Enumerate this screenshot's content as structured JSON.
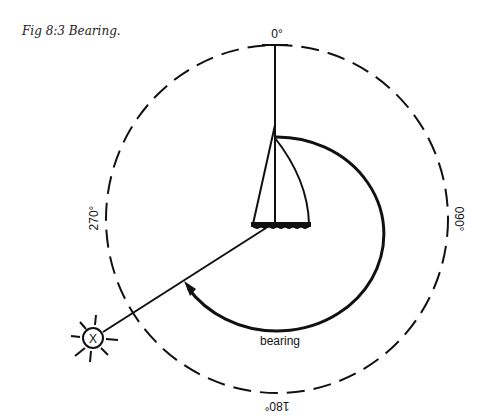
{
  "caption": "Fig 8:3 Bearing.",
  "labels": {
    "north": "0°",
    "east": "090°",
    "south": "180°",
    "west": "270°",
    "bearing": "bearing",
    "object_mark": "X"
  },
  "colors": {
    "ink": "#111111",
    "background": "#ffffff"
  },
  "bearing_degrees_approx": 240
}
